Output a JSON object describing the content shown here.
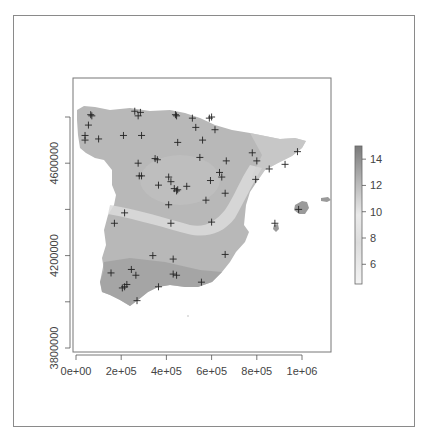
{
  "chart_data": {
    "type": "heatmap",
    "title": "",
    "xlabel": "",
    "ylabel": "",
    "x_ticks": [
      {
        "value": 0,
        "label": "0e+00"
      },
      {
        "value": 200000,
        "label": "2e+05"
      },
      {
        "value": 400000,
        "label": "4e+05"
      },
      {
        "value": 600000,
        "label": "6e+05"
      },
      {
        "value": 800000,
        "label": "8e+05"
      },
      {
        "value": 1000000,
        "label": "1e+06"
      }
    ],
    "y_ticks": [
      {
        "value": 3800000,
        "label": "3800000",
        "labeled": true
      },
      {
        "value": 4000000,
        "label": "",
        "labeled": false
      },
      {
        "value": 4200000,
        "label": "4200000",
        "labeled": true
      },
      {
        "value": 4400000,
        "label": "",
        "labeled": false
      },
      {
        "value": 4600000,
        "label": "4600000",
        "labeled": true
      },
      {
        "value": 4800000,
        "label": "",
        "labeled": false
      }
    ],
    "xlim": [
      -20000,
      1130000
    ],
    "ylim": [
      3780000,
      4940000
    ],
    "grid": false,
    "legend": {
      "type": "colorbar",
      "position": "right",
      "ticks": [
        6,
        8,
        10,
        12,
        14
      ],
      "range": [
        4.5,
        15
      ],
      "colors": {
        "low": "#f2f2f2",
        "mid": "#d8d8d8",
        "high": "#7a7a7a"
      }
    },
    "stations": [
      [
        65000,
        4810000
      ],
      [
        70000,
        4805000
      ],
      [
        55000,
        4765000
      ],
      [
        40000,
        4720000
      ],
      [
        40000,
        4700000
      ],
      [
        100000,
        4705000
      ],
      [
        260000,
        4825000
      ],
      [
        275000,
        4805000
      ],
      [
        285000,
        4820000
      ],
      [
        210000,
        4720000
      ],
      [
        290000,
        4720000
      ],
      [
        440000,
        4810000
      ],
      [
        445000,
        4805000
      ],
      [
        515000,
        4795000
      ],
      [
        590000,
        4795000
      ],
      [
        600000,
        4800000
      ],
      [
        530000,
        4755000
      ],
      [
        615000,
        4745000
      ],
      [
        450000,
        4690000
      ],
      [
        560000,
        4700000
      ],
      [
        350000,
        4620000
      ],
      [
        360000,
        4615000
      ],
      [
        275000,
        4600000
      ],
      [
        280000,
        4545000
      ],
      [
        290000,
        4545000
      ],
      [
        410000,
        4540000
      ],
      [
        420000,
        4520000
      ],
      [
        365000,
        4505000
      ],
      [
        435000,
        4490000
      ],
      [
        445000,
        4480000
      ],
      [
        450000,
        4485000
      ],
      [
        490000,
        4500000
      ],
      [
        548000,
        4625000
      ],
      [
        665000,
        4610000
      ],
      [
        635000,
        4560000
      ],
      [
        645000,
        4540000
      ],
      [
        595000,
        4525000
      ],
      [
        660000,
        4470000
      ],
      [
        575000,
        4440000
      ],
      [
        410000,
        4420000
      ],
      [
        780000,
        4645000
      ],
      [
        800000,
        4610000
      ],
      [
        855000,
        4575000
      ],
      [
        925000,
        4595000
      ],
      [
        980000,
        4650000
      ],
      [
        795000,
        4530000
      ],
      [
        985000,
        4400000
      ],
      [
        880000,
        4340000
      ],
      [
        215000,
        4385000
      ],
      [
        170000,
        4340000
      ],
      [
        420000,
        4340000
      ],
      [
        600000,
        4345000
      ],
      [
        340000,
        4200000
      ],
      [
        430000,
        4185000
      ],
      [
        660000,
        4205000
      ],
      [
        155000,
        4125000
      ],
      [
        245000,
        4140000
      ],
      [
        265000,
        4115000
      ],
      [
        430000,
        4120000
      ],
      [
        445000,
        4115000
      ],
      [
        205000,
        4060000
      ],
      [
        215000,
        4065000
      ],
      [
        225000,
        4075000
      ],
      [
        365000,
        4065000
      ],
      [
        555000,
        4085000
      ],
      [
        270000,
        4005000
      ]
    ]
  }
}
